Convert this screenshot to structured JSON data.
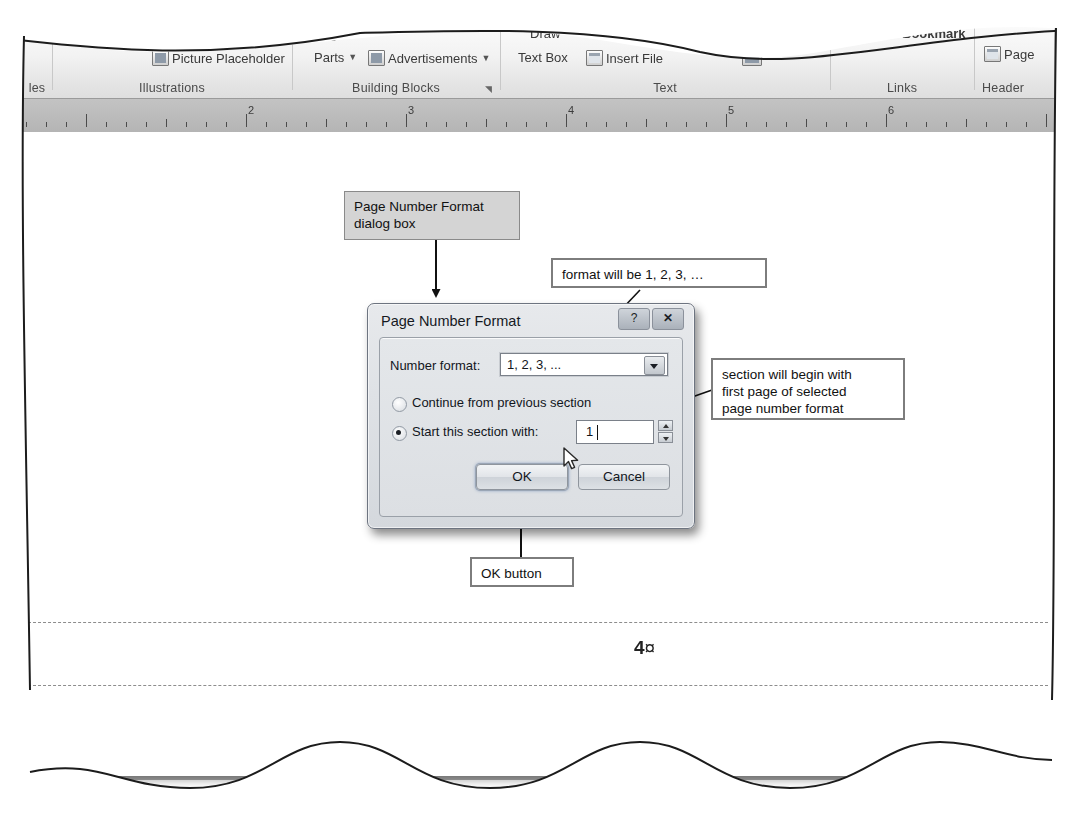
{
  "ribbon": {
    "groups": [
      {
        "caption": "les",
        "items": []
      },
      {
        "caption": "Illustrations",
        "items": [
          {
            "label": "Picture",
            "icon": "picture-icon",
            "has_icon": false
          },
          {
            "label": "Shapes",
            "icon": "shapes-icon",
            "has_icon": false
          },
          {
            "label": "Picture Placeholder",
            "icon": "picture-placeholder-icon",
            "has_icon": true
          }
        ]
      },
      {
        "caption": "Building Blocks",
        "launcher": "dialog-launcher",
        "items": [
          {
            "label": "Page",
            "icon": "page-parts-icon",
            "has_icon": false
          },
          {
            "label": "Parts",
            "icon": "page-parts-icon",
            "has_icon": false,
            "dropdown": true
          },
          {
            "label": "Advertisements",
            "icon": "advertisements-icon",
            "has_icon": true,
            "dropdown": true
          }
        ]
      },
      {
        "caption": "Text",
        "items": [
          {
            "label": "Draw",
            "icon": "draw-text-box-icon",
            "has_icon": false
          },
          {
            "label": "Text Box",
            "icon": "draw-text-box-icon",
            "has_icon": false
          },
          {
            "label": "Insert File",
            "icon": "insert-file-icon",
            "has_icon": true
          }
        ]
      },
      {
        "caption": "Links",
        "items": [
          {
            "label": "Hyperlink",
            "icon": "hyperlink-icon",
            "has_icon": false
          },
          {
            "label": "Bookmark",
            "icon": "bookmark-icon",
            "has_icon": false
          }
        ]
      },
      {
        "caption": "Header",
        "items": [
          {
            "label": "Page",
            "icon": "page-number-icon",
            "has_icon": true
          }
        ]
      }
    ]
  },
  "ruler": {
    "numbers": [
      "2",
      "3",
      "4",
      "5",
      "6"
    ]
  },
  "document": {
    "page_number": "4",
    "page_number_mark": "¤"
  },
  "callouts": [
    {
      "id": "dialog-box-callout",
      "text": "Page Number Format\ndialog box",
      "style": "grey"
    },
    {
      "id": "format-callout",
      "text": "format will be 1, 2, 3, …",
      "style": "white"
    },
    {
      "id": "section-callout",
      "text": "section will begin with\nfirst page of selected\npage number format",
      "style": "white"
    },
    {
      "id": "ok-button-callout",
      "text": "OK button",
      "style": "white"
    }
  ],
  "dialog": {
    "title": "Page Number Format",
    "help_button": "?",
    "close_button": "✕",
    "number_format_label": "Number format:",
    "number_format_value": "1, 2, 3, ...",
    "radio_continue_label": "Continue from previous section",
    "radio_continue_selected": false,
    "radio_start_label": "Start this section with:",
    "radio_start_selected": true,
    "start_value": "1",
    "ok_label": "OK",
    "cancel_label": "Cancel"
  },
  "colors": {
    "backdrop": "#a9a9a9",
    "page": "#ffffff",
    "ruler": "#bcbcbc",
    "callout_grey": "#d4d4d4",
    "dialog_face": "#dfe2e6"
  }
}
